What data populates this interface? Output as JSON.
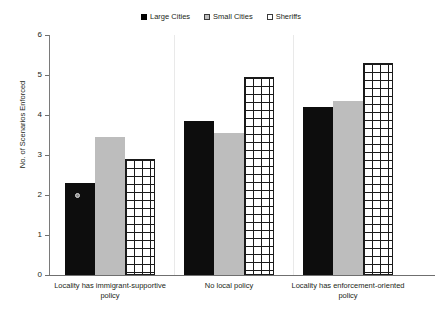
{
  "chart_data": {
    "type": "bar",
    "title": "",
    "xlabel": "",
    "ylabel": "No. of Scenarios Enforced",
    "ylim": [
      0,
      6
    ],
    "ytick_labels": [
      "6",
      "5",
      "4",
      "3",
      "2",
      "1",
      "0"
    ],
    "ytick_values": [
      6,
      5,
      4,
      3,
      2,
      1,
      0
    ],
    "grid": false,
    "legend_position": "top-center",
    "categories": [
      "Locality has immigrant-supportive policy",
      "No local policy",
      "Locality has enforcement-oriented policy"
    ],
    "category_lines": [
      [
        "Locality has immigrant-supportive",
        "policy"
      ],
      [
        "No local policy",
        ""
      ],
      [
        "Locality has enforcement-oriented",
        "policy"
      ]
    ],
    "series": [
      {
        "name": "Large Cities",
        "color": "#0d0d0d",
        "pattern": "solid",
        "values": [
          2.3,
          3.85,
          4.2
        ]
      },
      {
        "name": "Small Cities",
        "color": "#bdbdbd",
        "pattern": "gray-fill",
        "values": [
          3.45,
          3.55,
          4.35
        ]
      },
      {
        "name": "Sheriffs",
        "color": "#ffffff",
        "pattern": "crosshatch",
        "values": [
          2.9,
          4.95,
          5.3
        ]
      }
    ]
  },
  "legend": {
    "entries": [
      {
        "label": "Large Cities",
        "swatch": "solid-square-icon"
      },
      {
        "label": "Small Cities",
        "swatch": "gray-square-icon"
      },
      {
        "label": "Sheriffs",
        "swatch": "hollow-square-icon"
      }
    ]
  }
}
